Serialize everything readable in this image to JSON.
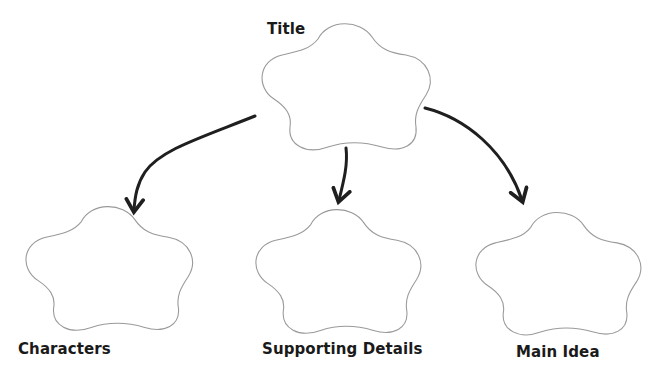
{
  "diagram": {
    "type": "graphic-organizer",
    "root": {
      "label": "Title"
    },
    "children": [
      {
        "label": "Characters"
      },
      {
        "label": "Supporting Details"
      },
      {
        "label": "Main Idea"
      }
    ],
    "colors": {
      "shape_stroke": "#9a9a9a",
      "arrow": "#1f1f1f",
      "text": "#1a1a1a",
      "background": "#ffffff"
    }
  }
}
